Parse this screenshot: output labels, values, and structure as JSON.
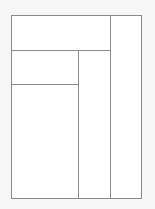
{
  "diagram": {
    "type": "layout-partition",
    "colors": {
      "background": "#f6f6f6",
      "panel": "#ffffff",
      "line": "#8a8a8a"
    },
    "regions": [
      {
        "id": "top"
      },
      {
        "id": "right"
      },
      {
        "id": "middle-left-top"
      },
      {
        "id": "middle-left-bottom"
      },
      {
        "id": "middle-center"
      }
    ]
  }
}
